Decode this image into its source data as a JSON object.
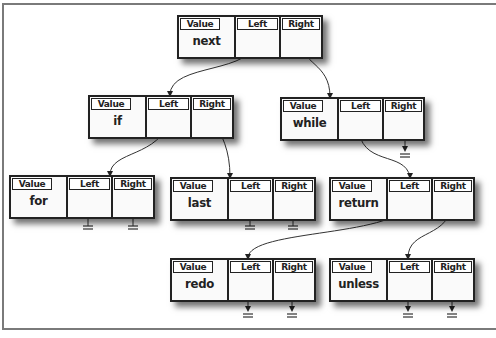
{
  "diagram": {
    "type": "binary-tree",
    "field_labels": {
      "value": "Value",
      "left": "Left",
      "right": "Right"
    },
    "nodes": {
      "next": {
        "value": "next",
        "left": "if",
        "right": "while"
      },
      "if": {
        "value": "if",
        "left": "for",
        "right": "last"
      },
      "while": {
        "value": "while",
        "left": "return",
        "right": null
      },
      "for": {
        "value": "for",
        "left": null,
        "right": null
      },
      "last": {
        "value": "last",
        "left": null,
        "right": null
      },
      "return": {
        "value": "return",
        "left": "redo",
        "right": "unless"
      },
      "redo": {
        "value": "redo",
        "left": null,
        "right": null
      },
      "unless": {
        "value": "unless",
        "left": null,
        "right": null
      }
    },
    "null_symbol": "ground"
  }
}
